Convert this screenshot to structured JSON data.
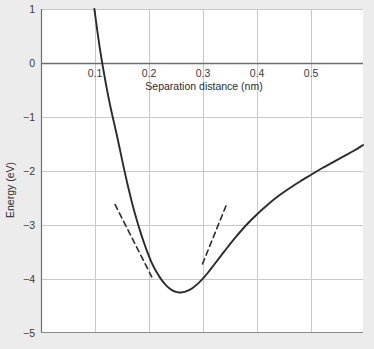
{
  "chart_data": {
    "type": "line",
    "title": "",
    "subtitle": "",
    "xlabel": "Separation distance (nm)",
    "ylabel": "Energy (eV)",
    "xlim": [
      0.0,
      0.596
    ],
    "ylim": [
      -5,
      1
    ],
    "grid": true,
    "legend": null,
    "xticks": [
      0.1,
      0.2,
      0.3,
      0.4,
      0.5
    ],
    "xtick_labels": [
      "0.1",
      "0.2",
      "0.3",
      "0.4",
      "0.5"
    ],
    "yticks": [
      1,
      0,
      -1,
      -2,
      -3,
      -4,
      -5
    ],
    "ytick_labels": [
      "1",
      "0",
      "-1",
      "-2",
      "-3",
      "-4",
      "-5"
    ],
    "series": [
      {
        "name": "Potential energy curve",
        "style": "solid",
        "color": "#2b2b2b",
        "x": [
          0.0988,
          0.102,
          0.106,
          0.11,
          0.115,
          0.12,
          0.125,
          0.13,
          0.135,
          0.14,
          0.145,
          0.15,
          0.155,
          0.16,
          0.165,
          0.17,
          0.175,
          0.18,
          0.185,
          0.19,
          0.195,
          0.2,
          0.205,
          0.21,
          0.215,
          0.22,
          0.225,
          0.23,
          0.235,
          0.24,
          0.245,
          0.25,
          0.255,
          0.26,
          0.265,
          0.27,
          0.275,
          0.28,
          0.29,
          0.3,
          0.31,
          0.32,
          0.33,
          0.34,
          0.36,
          0.38,
          0.4,
          0.42,
          0.44,
          0.46,
          0.48,
          0.5,
          0.52,
          0.54,
          0.56,
          0.58,
          0.596
        ],
        "y": [
          1.0,
          0.76,
          0.47,
          0.2,
          -0.1,
          -0.38,
          -0.64,
          -0.88,
          -1.1,
          -1.32,
          -1.55,
          -1.79,
          -2.02,
          -2.24,
          -2.45,
          -2.65,
          -2.83,
          -3.0,
          -3.16,
          -3.31,
          -3.45,
          -3.58,
          -3.7,
          -3.8,
          -3.89,
          -3.97,
          -4.04,
          -4.1,
          -4.15,
          -4.19,
          -4.22,
          -4.24,
          -4.25,
          -4.25,
          -4.24,
          -4.22,
          -4.2,
          -4.17,
          -4.09,
          -3.99,
          -3.87,
          -3.74,
          -3.61,
          -3.48,
          -3.23,
          -3.0,
          -2.8,
          -2.62,
          -2.46,
          -2.32,
          -2.19,
          -2.07,
          -1.95,
          -1.84,
          -1.73,
          -1.62,
          -1.52
        ]
      },
      {
        "name": "Left tangent line",
        "style": "dashed",
        "color": "#2b2b2b",
        "x": [
          0.137,
          0.205
        ],
        "y": [
          -2.62,
          -3.96
        ]
      },
      {
        "name": "Right tangent line",
        "style": "dashed",
        "color": "#2b2b2b",
        "x": [
          0.299,
          0.343
        ],
        "y": [
          -3.72,
          -2.63
        ]
      }
    ],
    "annotations": [],
    "colors": {
      "curve": "#2b2b2b",
      "grid": "#c9c9c9",
      "axis": "#6e6e6e",
      "zero_line": "#6e6e6e",
      "plot_background": "#ffffff",
      "figure_background": "#ececec",
      "text": "#2b2b2b"
    }
  }
}
